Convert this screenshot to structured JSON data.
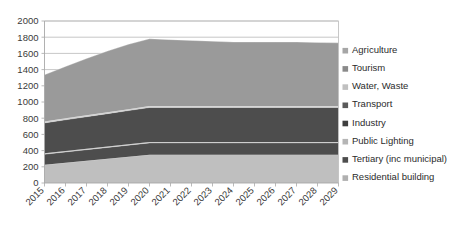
{
  "chart_data": {
    "type": "area",
    "title": "",
    "xlabel": "",
    "ylabel": "",
    "stacked": true,
    "grid": true,
    "legend_position": "right",
    "ylim": [
      0,
      2000
    ],
    "yticks": [
      0,
      200,
      400,
      600,
      800,
      1000,
      1200,
      1400,
      1600,
      1800,
      2000
    ],
    "ytick_labels": [
      "0",
      "200",
      "400",
      "600",
      "800",
      "1000",
      "1200",
      "1400",
      "1600",
      "1800",
      "2000"
    ],
    "categories": [
      "2015",
      "2016",
      "2017",
      "2018",
      "2019",
      "2020",
      "2021",
      "2022",
      "2023",
      "2024",
      "2025",
      "2026",
      "2027",
      "2028",
      "2029"
    ],
    "stack_order_bottom_to_top": [
      "Residential building",
      "Tertiary (inc municipal)",
      "Public Lighting",
      "Industry",
      "Transport",
      "Water, Waste",
      "Tourism",
      "Agriculture"
    ],
    "series": [
      {
        "name": "Residential building",
        "color": "#bfbfbf",
        "values": [
          225,
          250,
          275,
          300,
          325,
          350,
          350,
          350,
          350,
          350,
          350,
          350,
          350,
          350,
          350
        ]
      },
      {
        "name": "Tertiary (inc municipal)",
        "color": "#4d4d4d",
        "values": [
          130,
          133,
          136,
          139,
          142,
          145,
          145,
          145,
          145,
          145,
          145,
          145,
          145,
          145,
          145
        ]
      },
      {
        "name": "Public Lighting",
        "color": "#c8c8c8",
        "values": [
          12,
          12,
          12,
          12,
          12,
          12,
          12,
          12,
          12,
          12,
          12,
          12,
          12,
          12,
          12
        ]
      },
      {
        "name": "Industry",
        "color": "#4d4d4d",
        "values": [
          375,
          385,
          395,
          405,
          415,
          425,
          425,
          425,
          425,
          425,
          425,
          425,
          425,
          425,
          425
        ]
      },
      {
        "name": "Transport",
        "color": "#d0d0d0",
        "values": [
          18,
          18,
          18,
          18,
          18,
          18,
          18,
          18,
          18,
          18,
          18,
          18,
          18,
          18,
          18
        ]
      },
      {
        "name": "Water, Waste",
        "color": "#9a9a9a",
        "values": [
          575,
          640,
          700,
          755,
          800,
          830,
          820,
          810,
          800,
          790,
          790,
          790,
          790,
          785,
          780
        ]
      },
      {
        "name": "Tourism",
        "color": "#8a8a8a",
        "values": [
          0,
          0,
          0,
          0,
          0,
          0,
          0,
          0,
          0,
          0,
          0,
          0,
          0,
          0,
          0
        ]
      },
      {
        "name": "Agriculture",
        "color": "#a6a6a6",
        "values": [
          0,
          0,
          0,
          0,
          0,
          0,
          0,
          0,
          0,
          0,
          0,
          0,
          0,
          0,
          0
        ]
      }
    ],
    "totals": [
      1335,
      1438,
      1536,
      1629,
      1712,
      1780,
      1770,
      1760,
      1750,
      1740,
      1740,
      1740,
      1740,
      1735,
      1730
    ]
  },
  "legend": {
    "items": [
      {
        "label": "Agriculture",
        "color": "#a6a6a6"
      },
      {
        "label": "Tourism",
        "color": "#8a8a8a"
      },
      {
        "label": "Water, Waste",
        "color": "#c0c0c0"
      },
      {
        "label": "Transport",
        "color": "#5a5a5a"
      },
      {
        "label": "Industry",
        "color": "#3f3f3f"
      },
      {
        "label": "Public Lighting",
        "color": "#b5b5b5"
      },
      {
        "label": "Tertiary (inc municipal)",
        "color": "#4d4d4d"
      },
      {
        "label": "Residential building",
        "color": "#b0b0b0"
      }
    ]
  },
  "colors": {
    "background": "#ffffff",
    "gridline": "#b9b9b9",
    "axis": "#a8a8a8",
    "text": "#3a3a3a"
  }
}
